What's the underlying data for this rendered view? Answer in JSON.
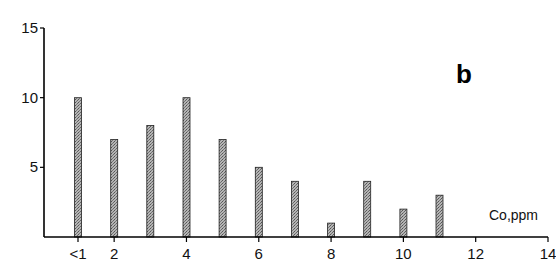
{
  "chart_data": {
    "type": "bar",
    "title": "",
    "panel_label": "b",
    "xlabel": "Co,ppm",
    "ylabel": "",
    "categories": [
      "<1",
      "1",
      "2",
      "3",
      "4",
      "5",
      "6",
      "7",
      "8",
      "9",
      "10"
    ],
    "values": [
      10,
      7,
      8,
      10,
      7,
      5,
      4,
      1,
      4,
      2,
      3
    ],
    "x_positions": [
      1,
      2,
      3,
      4,
      5,
      6,
      7,
      8,
      9,
      10,
      11
    ],
    "xlim": [
      0,
      14
    ],
    "ylim": [
      0,
      15
    ],
    "x_ticks": [
      {
        "pos": 1,
        "label": "<1"
      },
      {
        "pos": 2,
        "label": "2"
      },
      {
        "pos": 4,
        "label": "4"
      },
      {
        "pos": 6,
        "label": "6"
      },
      {
        "pos": 8,
        "label": "8"
      },
      {
        "pos": 10,
        "label": "10"
      },
      {
        "pos": 12,
        "label": "12"
      },
      {
        "pos": 14,
        "label": "14"
      }
    ],
    "y_ticks": [
      {
        "value": 5,
        "label": "5"
      },
      {
        "value": 10,
        "label": "10"
      },
      {
        "value": 15,
        "label": "15"
      }
    ],
    "grid": false,
    "legend": null,
    "bar_color": "#9a9a9a",
    "bar_edge_color": "#222222"
  }
}
